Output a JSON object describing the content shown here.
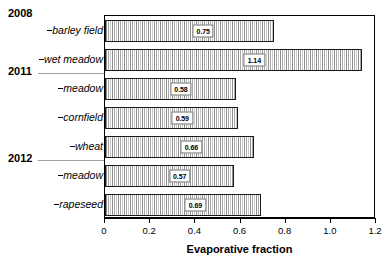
{
  "chart_data": {
    "type": "bar",
    "orientation": "horizontal",
    "title": "",
    "xlabel": "Evaporative fraction",
    "ylabel": "",
    "xlim": [
      0,
      1.2
    ],
    "xticks": [
      "0",
      "0.2",
      "0.4",
      "0.6",
      "0.8",
      "1.0",
      "1.2"
    ],
    "xtick_values": [
      0,
      0.2,
      0.4,
      0.6,
      0.8,
      1.0,
      1.2
    ],
    "grid": false,
    "legend": "none",
    "groups": [
      {
        "year": "2008",
        "categories": [
          "barley field",
          "wet meadow"
        ],
        "values": [
          0.75,
          1.14
        ]
      },
      {
        "year": "2011",
        "categories": [
          "meadow",
          "cornfield",
          "wheat"
        ],
        "values": [
          0.58,
          0.59,
          0.66
        ]
      },
      {
        "year": "2012",
        "categories": [
          "meadow",
          "rapeseed"
        ],
        "values": [
          0.57,
          0.69
        ]
      }
    ],
    "categories": [
      "barley field",
      "wet meadow",
      "meadow",
      "cornfield",
      "wheat",
      "meadow",
      "rapeseed"
    ],
    "values": [
      0.75,
      1.14,
      0.58,
      0.59,
      0.66,
      0.57,
      0.69
    ],
    "data_labels": [
      "0.75",
      "1.14",
      "0.58",
      "0.59",
      "0.66",
      "0.57",
      "0.69"
    ]
  },
  "rows": [
    {
      "label": "barley field",
      "value": 0.75,
      "display": "0.75"
    },
    {
      "label": "wet meadow",
      "value": 1.14,
      "display": "1.14"
    },
    {
      "label": "meadow",
      "value": 0.58,
      "display": "0.58"
    },
    {
      "label": "cornfield",
      "value": 0.59,
      "display": "0.59"
    },
    {
      "label": "wheat",
      "value": 0.66,
      "display": "0.66"
    },
    {
      "label": "meadow",
      "value": 0.57,
      "display": "0.57"
    },
    {
      "label": "rapeseed",
      "value": 0.69,
      "display": "0.69"
    }
  ],
  "years": [
    {
      "label": "2008"
    },
    {
      "label": "2011"
    },
    {
      "label": "2012"
    }
  ],
  "axis": {
    "title": "Evaporative fraction",
    "ticks": [
      "0",
      "0.2",
      "0.4",
      "0.6",
      "0.8",
      "1.0",
      "1.2"
    ]
  },
  "colors": {
    "bar_fill": "#b4b4b4",
    "bar_edge": "#1a1a1a",
    "axis": "#000000",
    "group_rule": "#a0a0a0",
    "label_box_border": "#6e6e6e"
  }
}
